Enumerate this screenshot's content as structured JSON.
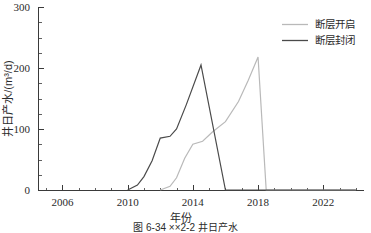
{
  "chart_data": {
    "type": "line",
    "title": "",
    "xlabel": "年份",
    "ylabel": "井日产水/(m³/d)",
    "xlim": [
      2004.5,
      2024.5
    ],
    "ylim": [
      0,
      300
    ],
    "xticks": [
      2006,
      2010,
      2014,
      2018,
      2022
    ],
    "xtick_labels": [
      "2006",
      "2010",
      "2014",
      "2018",
      "2022"
    ],
    "yticks": [
      0,
      100,
      200,
      300
    ],
    "ytick_labels": [
      "0",
      "100",
      "200",
      "300"
    ],
    "x_minor_interval": 1,
    "y_minor_interval": 25,
    "grid": false,
    "legend_position": "top-right",
    "series": [
      {
        "name": "断层开启",
        "color": "#b9b9b9",
        "points": [
          {
            "x": 2012.0,
            "y": 0
          },
          {
            "x": 2012.6,
            "y": 6
          },
          {
            "x": 2013.0,
            "y": 20
          },
          {
            "x": 2013.5,
            "y": 52
          },
          {
            "x": 2014.0,
            "y": 75
          },
          {
            "x": 2014.6,
            "y": 80
          },
          {
            "x": 2015.2,
            "y": 95
          },
          {
            "x": 2016.0,
            "y": 112
          },
          {
            "x": 2016.8,
            "y": 145
          },
          {
            "x": 2017.4,
            "y": 180
          },
          {
            "x": 2018.0,
            "y": 218
          },
          {
            "x": 2018.5,
            "y": 0
          },
          {
            "x": 2024.0,
            "y": 0
          }
        ]
      },
      {
        "name": "断层封闭",
        "color": "#4a4a4a",
        "points": [
          {
            "x": 2010.0,
            "y": 0
          },
          {
            "x": 2010.6,
            "y": 8
          },
          {
            "x": 2011.0,
            "y": 22
          },
          {
            "x": 2011.5,
            "y": 48
          },
          {
            "x": 2012.0,
            "y": 85
          },
          {
            "x": 2012.6,
            "y": 88
          },
          {
            "x": 2013.0,
            "y": 100
          },
          {
            "x": 2013.6,
            "y": 140
          },
          {
            "x": 2014.5,
            "y": 205
          },
          {
            "x": 2016.0,
            "y": 0
          },
          {
            "x": 2024.0,
            "y": 0
          }
        ]
      }
    ],
    "legend": [
      {
        "label": "断层开启",
        "color": "#b9b9b9"
      },
      {
        "label": "断层封闭",
        "color": "#4a4a4a"
      }
    ]
  },
  "caption": {
    "text": "图 6-34  ××2-2 井日产水"
  }
}
